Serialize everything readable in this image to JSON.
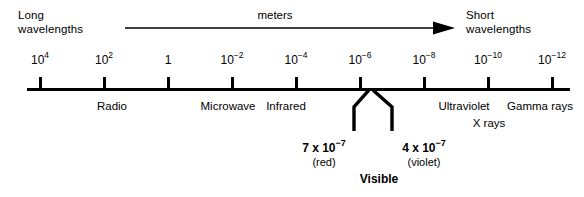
{
  "figure": {
    "unit_label": "meters",
    "left_corner_label": "Long\nwavelengths",
    "right_corner_label": "Short\nwavelengths",
    "line_color": "#000000",
    "background_color": "#ffffff"
  },
  "chart_data": {
    "type": "line",
    "xlabel": "meters",
    "ylabel": "",
    "grid": false,
    "legend": "none",
    "axis_direction_annotation": {
      "label": "meters",
      "from": "Long wavelengths",
      "to": "Short wavelengths",
      "arrow": "right"
    },
    "axis_ticks": [
      {
        "label": "10",
        "exponent": "4",
        "x_px": 40
      },
      {
        "label": "10",
        "exponent": "2",
        "x_px": 104
      },
      {
        "label": "1",
        "exponent": "",
        "x_px": 168
      },
      {
        "label": "10",
        "exponent": "-2",
        "x_px": 232
      },
      {
        "label": "10",
        "exponent": "-4",
        "x_px": 296
      },
      {
        "label": "10",
        "exponent": "-6",
        "x_px": 360
      },
      {
        "label": "10",
        "exponent": "-8",
        "x_px": 424
      },
      {
        "label": "10",
        "exponent": "-10",
        "x_px": 488
      },
      {
        "label": "10",
        "exponent": "-12",
        "x_px": 552
      }
    ],
    "bands": [
      {
        "name": "Radio",
        "x_px": 112,
        "row": 1
      },
      {
        "name": "Microwave",
        "x_px": 228,
        "row": 1
      },
      {
        "name": "Infrared",
        "x_px": 286,
        "row": 1
      },
      {
        "name": "Ultraviolet",
        "x_px": 464,
        "row": 1
      },
      {
        "name": "Gamma rays",
        "x_px": 540,
        "row": 1
      },
      {
        "name": "X rays",
        "x_px": 489,
        "row": 2
      }
    ],
    "visible_range": {
      "caption": "Visible",
      "apex_x_px": 371,
      "endpoints": [
        {
          "value": "7 x 10",
          "exponent": "-7",
          "color_name": "(red)",
          "x_px": 324
        },
        {
          "value": "4 x 10",
          "exponent": "-7",
          "color_name": "(violet)",
          "x_px": 424
        }
      ]
    }
  }
}
